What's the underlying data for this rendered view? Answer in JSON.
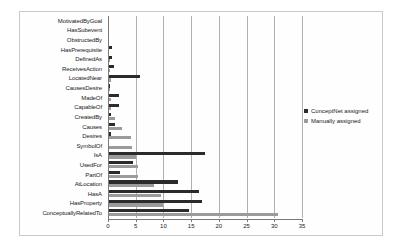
{
  "chart_data": {
    "type": "bar",
    "orientation": "horizontal",
    "title": "",
    "xlabel": "",
    "ylabel": "",
    "xlim": [
      0,
      35
    ],
    "xticks": [
      0,
      5,
      10,
      15,
      20,
      25,
      30,
      35
    ],
    "grid": true,
    "legend_position": "right",
    "categories": [
      "MotivatedByGoal",
      "HasSubevent",
      "ObstructedBy",
      "HasPrerequisite",
      "DefinedAs",
      "ReceivesAction",
      "LocatedNear",
      "CausesDesire",
      "MadeOf",
      "CapableOf",
      "CreatedBy",
      "Causes",
      "Desires",
      "SymbolOf",
      "IsA",
      "UsedFor",
      "PartOf",
      "AtLocation",
      "HasA",
      "HasProperty",
      "ConceptuallyRelatedTo"
    ],
    "series": [
      {
        "name": "ConceptNet assigned",
        "color": "#2b2b2b",
        "values": [
          0.15,
          0.2,
          0.2,
          0.7,
          0.7,
          1.0,
          5.8,
          0.3,
          2.0,
          2.0,
          0.6,
          1.2,
          0.5,
          0.1,
          17.5,
          4.5,
          2.2,
          12.6,
          16.4,
          17.0,
          14.6
        ]
      },
      {
        "name": "Manually assigned",
        "color": "#9b9b9b",
        "values": [
          0.0,
          0.0,
          0.0,
          0.0,
          0.3,
          0.4,
          0.6,
          0.4,
          0.6,
          0.6,
          1.3,
          2.5,
          4.1,
          4.4,
          5.0,
          5.5,
          5.5,
          8.3,
          9.6,
          10.0,
          30.6
        ]
      }
    ]
  },
  "legend": {
    "items": [
      {
        "label": "ConceptNet assigned"
      },
      {
        "label": "Manually assigned"
      }
    ]
  }
}
